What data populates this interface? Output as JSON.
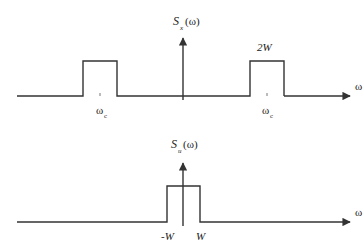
{
  "top_plot": {
    "ylabel_main": "S",
    "ylabel_sub": "x",
    "ylabel_arg": "(ω)",
    "xlabel": "ω",
    "left_tick_label": "ω",
    "left_tick_sub": "c",
    "right_tick_label": "ω",
    "right_tick_sub": "c",
    "width_label": "2W"
  },
  "bottom_plot": {
    "ylabel_main": "S",
    "ylabel_sub": "u",
    "ylabel_arg": "(ω)",
    "xlabel": "ω",
    "neg_tick_label": "-W",
    "pos_tick_label": "W"
  },
  "colors": {
    "line": "#333333",
    "text": "#222222"
  }
}
